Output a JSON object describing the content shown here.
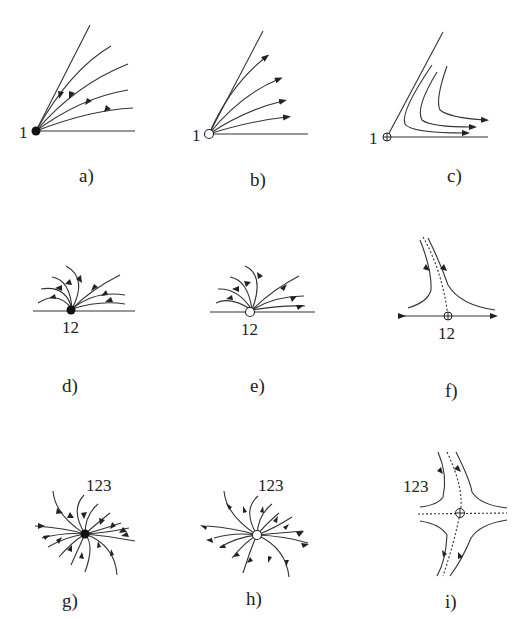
{
  "figure": {
    "panels": [
      {
        "id": "a",
        "caption": "a)",
        "point_label": "1",
        "point_type": "filled",
        "flow": "incoming",
        "description": "sector between horizontal line and oblique ray; trajectories approach point 1"
      },
      {
        "id": "b",
        "caption": "b)",
        "point_label": "1",
        "point_type": "open",
        "flow": "outgoing",
        "description": "sector; trajectories leave point 1"
      },
      {
        "id": "c",
        "caption": "c)",
        "point_label": "1",
        "point_type": "crossed",
        "flow": "hyperbolic",
        "description": "sector with hyperbolic trajectories turning, arrows pointing right"
      },
      {
        "id": "d",
        "caption": "d)",
        "point_label": "12",
        "point_type": "filled",
        "flow": "incoming",
        "description": "half-plane node on boundary line; trajectories approach point 12"
      },
      {
        "id": "e",
        "caption": "e)",
        "point_label": "12",
        "point_type": "open",
        "flow": "outgoing",
        "description": "half-plane node; trajectories leave point 12"
      },
      {
        "id": "f",
        "caption": "f)",
        "point_label": "12",
        "point_type": "crossed",
        "flow": "saddle",
        "description": "half-plane saddle; dotted separatrix, boundary arrows outward"
      },
      {
        "id": "g",
        "caption": "g)",
        "point_label": "123",
        "point_type": "filled",
        "flow": "incoming",
        "description": "stable node in plane"
      },
      {
        "id": "h",
        "caption": "h)",
        "point_label": "123",
        "point_type": "open",
        "flow": "outgoing",
        "description": "unstable node in plane"
      },
      {
        "id": "i",
        "caption": "i)",
        "point_label": "123",
        "point_type": "crossed",
        "flow": "saddle",
        "description": "saddle with dotted separatrices"
      }
    ]
  }
}
